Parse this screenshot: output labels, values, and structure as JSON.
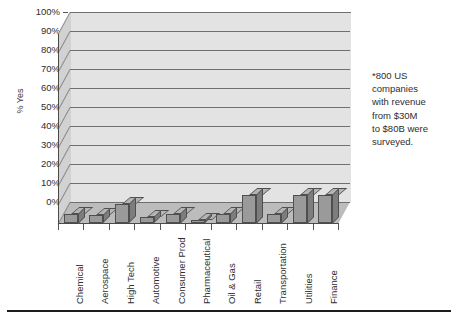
{
  "chart_data": {
    "type": "bar",
    "title": "",
    "subtitle": "",
    "xlabel": "",
    "ylabel": "% Yes",
    "ylim": [
      0,
      100
    ],
    "grid": true,
    "legend": "none",
    "style": "3d-column",
    "categories": [
      "Chemical",
      "Aerospace",
      "High Tech",
      "Automotive",
      "Consumer Prod",
      "Pharmaceutical",
      "Oil & Gas",
      "Retail",
      "Transportation",
      "Utilities",
      "Finance"
    ],
    "values": [
      5,
      4,
      10,
      3,
      5,
      1,
      5,
      15,
      5,
      15,
      15
    ],
    "y_ticks": [
      "0%",
      "10%",
      "20%",
      "30%",
      "40%",
      "50%",
      "60%",
      "70%",
      "80%",
      "90%",
      "100%"
    ],
    "y_tick_values": [
      0,
      10,
      20,
      30,
      40,
      50,
      60,
      70,
      80,
      90,
      100
    ],
    "annotations": [
      "*800 US companies with revenue from $30M to $80B were surveyed."
    ],
    "colors": {
      "bar_front": "#9a9a9a",
      "bar_top": "#b4b4b4",
      "bar_side": "#7d7d7d",
      "bar_outline": "#4f4f4f",
      "plot_back_wall": "#e3e3e3",
      "plot_left_wall": "#d2d2d2",
      "plot_floor": "#bcbcbc",
      "gridline": "#6f6f6f",
      "text": "#2e2e2e",
      "rule": "#1d1d1d"
    }
  },
  "axis": {
    "y_title": "% Yes"
  },
  "note": {
    "line1": "*800 US",
    "line2": "companies",
    "line3": "with revenue",
    "line4": "from $30M",
    "line5": "to $80B were",
    "line6": "surveyed."
  }
}
